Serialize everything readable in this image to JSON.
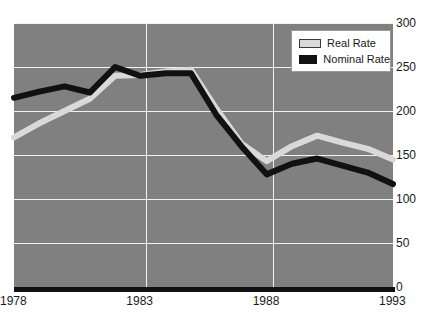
{
  "top_sliver_text": "",
  "legend": {
    "position": "top-right-inside",
    "items": [
      {
        "label": "Real Rate",
        "swatch": "real-rate-swatch",
        "color": "#d9d9d9"
      },
      {
        "label": "Nominal Rate",
        "swatch": "nominal-rate-swatch",
        "color": "#111111"
      }
    ]
  },
  "axes": {
    "y_ticks": [
      "0",
      "50",
      "100",
      "150",
      "200",
      "250",
      "300"
    ],
    "x_ticks": [
      "1978",
      "1983",
      "1988",
      "1993"
    ]
  },
  "chart_data": {
    "type": "line",
    "title": "",
    "xlabel": "",
    "ylabel": "",
    "xlim": [
      1978,
      1993
    ],
    "ylim": [
      0,
      300
    ],
    "ytick_step": 50,
    "grid": true,
    "legend_position": "upper right",
    "background_color": "#808080",
    "gridline_color": "#f2f2f2",
    "x": [
      1978,
      1979,
      1980,
      1981,
      1982,
      1983,
      1984,
      1985,
      1986,
      1987,
      1988,
      1989,
      1990,
      1991,
      1992,
      1993
    ],
    "series": [
      {
        "name": "Nominal Rate",
        "color": "#111111",
        "values": [
          215,
          222,
          228,
          221,
          250,
          240,
          243,
          243,
          196,
          160,
          128,
          140,
          146,
          138,
          130,
          117
        ]
      },
      {
        "name": "Real Rate",
        "color": "#d9d9d9",
        "values": [
          170,
          186,
          200,
          214,
          240,
          241,
          245,
          247,
          203,
          163,
          143,
          160,
          172,
          164,
          157,
          145
        ]
      }
    ]
  }
}
